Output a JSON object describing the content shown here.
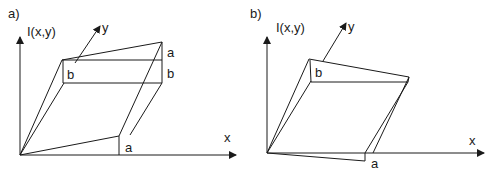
{
  "panels": [
    {
      "id": "a",
      "panel_label": "a)",
      "axis_labels": {
        "vertical": "I(x,y)",
        "x": "x",
        "y": "y"
      },
      "edge_labels": {
        "top_right_a": "a",
        "right_b": "b",
        "left_b": "b",
        "bottom_a": "a"
      }
    },
    {
      "id": "b",
      "panel_label": "b)",
      "axis_labels": {
        "vertical": "I(x,y)",
        "x": "x",
        "y": "y"
      },
      "edge_labels": {
        "left_b": "b",
        "bottom_a": "a"
      }
    }
  ]
}
